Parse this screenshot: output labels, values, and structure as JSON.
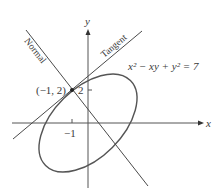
{
  "figure": {
    "equation": "x² − xy + y² = 7",
    "axes": {
      "x_label": "x",
      "y_label": "y"
    },
    "ticks": {
      "x_tick_label": "−1",
      "y_tick_label": "2"
    },
    "point": {
      "label": "(−1, 2)",
      "x": -1,
      "y": 2
    },
    "lines": {
      "tangent_label": "Tangent",
      "normal_label": "Normal"
    },
    "colors": {
      "curve": "#555555",
      "lines": "#4a4a4a",
      "axes": "#555555",
      "text": "#3a3a3a"
    }
  }
}
